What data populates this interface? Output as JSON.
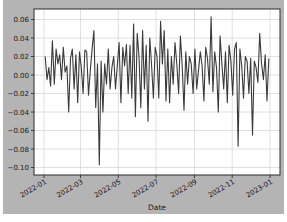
{
  "chart_data": {
    "type": "line",
    "title": "",
    "xlabel": "Date",
    "ylabel": "",
    "grid": true,
    "legend": null,
    "xlim": [
      "2021-12-18",
      "2023-01-15"
    ],
    "ylim": [
      -0.106,
      0.067
    ],
    "x_ticks": [
      "2022-01",
      "2022-03",
      "2022-05",
      "2022-07",
      "2022-09",
      "2022-11",
      "2023-01"
    ],
    "y_ticks": [
      0.06,
      0.04,
      0.02,
      0.0,
      -0.02,
      -0.04,
      -0.06,
      -0.08,
      -0.1
    ],
    "y_tick_labels": [
      "0.06",
      "0.04",
      "0.02",
      "0.00",
      "−0.02",
      "−0.04",
      "−0.06",
      "−0.08",
      "−0.10"
    ],
    "series": [
      {
        "name": "returns",
        "color": "#3a3a3a",
        "x_start": "2022-01-03",
        "x_end": "2022-12-30",
        "values": [
          0.02,
          -0.005,
          0.008,
          -0.012,
          0.037,
          -0.01,
          0.028,
          0.012,
          0.022,
          -0.005,
          0.03,
          0.003,
          0.01,
          -0.04,
          0.018,
          0.028,
          -0.015,
          0.022,
          -0.03,
          0.025,
          0.008,
          -0.02,
          0.027,
          0.025,
          -0.022,
          0.005,
          0.028,
          0.048,
          -0.035,
          0.012,
          -0.097,
          0.015,
          -0.04,
          0.012,
          -0.01,
          0.028,
          -0.015,
          0.008,
          0.02,
          -0.015,
          0.01,
          0.035,
          -0.03,
          0.03,
          0.01,
          0.033,
          -0.02,
          0.032,
          -0.025,
          0.055,
          -0.045,
          0.045,
          0.02,
          -0.035,
          0.048,
          -0.015,
          0.032,
          -0.05,
          0.04,
          0.01,
          -0.025,
          0.03,
          0.02,
          -0.025,
          0.058,
          0.012,
          0.048,
          -0.028,
          0.028,
          -0.03,
          0.02,
          -0.01,
          0.035,
          0.012,
          -0.02,
          0.042,
          0.01,
          -0.038,
          0.025,
          -0.01,
          0.02,
          0.012,
          -0.02,
          0.028,
          -0.015,
          0.005,
          0.025,
          0.01,
          -0.028,
          0.03,
          0.018,
          -0.01,
          0.063,
          -0.018,
          0.025,
          0.008,
          -0.04,
          0.042,
          0.012,
          -0.015,
          0.025,
          -0.03,
          0.032,
          0.015,
          -0.022,
          0.028,
          0.035,
          -0.077,
          0.028,
          0.01,
          -0.025,
          0.02,
          0.015,
          -0.02,
          0.018,
          -0.065,
          0.015,
          0.008,
          -0.008,
          0.045,
          0.012,
          -0.005,
          0.022,
          -0.028,
          0.018
        ]
      }
    ]
  },
  "figure": {
    "background": "#b4b4b4",
    "axes_background": "#ffffff",
    "grid_color": "#d8d8d8",
    "frame_color": "#2a2a2a"
  }
}
